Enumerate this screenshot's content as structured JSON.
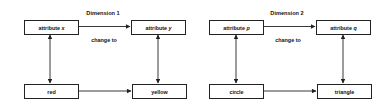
{
  "diagrams": [
    {
      "title": "Dimension 1",
      "edge_label": "change to",
      "top_left": {
        "text": "attribute",
        "var": "x"
      },
      "top_right": {
        "text": "attribute",
        "var": "y"
      },
      "bottom_left": {
        "text": "red"
      },
      "bottom_right": {
        "text": "yellow"
      }
    },
    {
      "title": "Dimension 2",
      "edge_label": "change to",
      "top_left": {
        "text": "attribute",
        "var": "p"
      },
      "top_right": {
        "text": "attribute",
        "var": "q"
      },
      "bottom_left": {
        "text": "circle"
      },
      "bottom_right": {
        "text": "triangle"
      }
    }
  ],
  "colors": {
    "stroke": "#222222",
    "text": "#111111",
    "background": "#ffffff"
  }
}
